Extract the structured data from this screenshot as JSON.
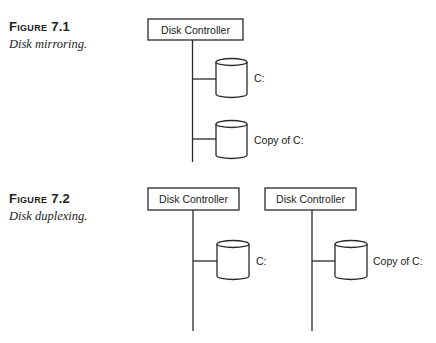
{
  "figures": [
    {
      "label": "Figure 7.1",
      "caption": "Disk mirroring.",
      "controllers": [
        {
          "label": "Disk Controller"
        }
      ],
      "disks": [
        {
          "label": "C:"
        },
        {
          "label": "Copy of C:"
        }
      ]
    },
    {
      "label": "Figure 7.2",
      "caption": "Disk duplexing.",
      "controllers": [
        {
          "label": "Disk Controller"
        },
        {
          "label": "Disk Controller"
        }
      ],
      "disks": [
        {
          "label": "C:"
        },
        {
          "label": "Copy of C:"
        }
      ]
    }
  ]
}
